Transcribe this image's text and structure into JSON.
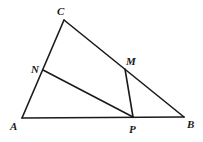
{
  "diagram": {
    "type": "geometry-triangle",
    "points": {
      "A": {
        "label": "A",
        "x": 22,
        "y": 118,
        "label_x": 10,
        "label_y": 130
      },
      "B": {
        "label": "B",
        "x": 184,
        "y": 117,
        "label_x": 187,
        "label_y": 128
      },
      "C": {
        "label": "C",
        "x": 64,
        "y": 20,
        "label_x": 57,
        "label_y": 15
      },
      "N": {
        "label": "N",
        "x": 43,
        "y": 70,
        "label_x": 31,
        "label_y": 73
      },
      "M": {
        "label": "M",
        "x": 125,
        "y": 69,
        "label_x": 126,
        "label_y": 65
      },
      "P": {
        "label": "P",
        "x": 133,
        "y": 117,
        "label_x": 129,
        "label_y": 133
      }
    },
    "segments": [
      {
        "from": "A",
        "to": "C"
      },
      {
        "from": "C",
        "to": "B"
      },
      {
        "from": "A",
        "to": "B"
      },
      {
        "from": "N",
        "to": "P"
      },
      {
        "from": "M",
        "to": "P"
      }
    ]
  }
}
